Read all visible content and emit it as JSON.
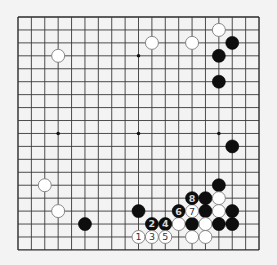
{
  "board": {
    "size": 19,
    "origin": {
      "x": 18,
      "y": 17
    },
    "spacing": {
      "x": 13.39,
      "y": 12.94
    },
    "stone_radius": 6.5,
    "colors": {
      "background": "#f3f3f3",
      "grid": "#3a3a3a",
      "black_stone": "#0e0e0e",
      "white_stone": "#ffffff",
      "white_stone_border": "#7a7a7a"
    },
    "hoshi": [
      [
        3,
        3
      ],
      [
        9,
        3
      ],
      [
        15,
        3
      ],
      [
        3,
        9
      ],
      [
        9,
        9
      ],
      [
        15,
        9
      ],
      [
        3,
        15
      ],
      [
        9,
        15
      ],
      [
        15,
        15
      ]
    ]
  },
  "stones": [
    {
      "color": "white",
      "col": 3,
      "row": 3,
      "label": ""
    },
    {
      "color": "white",
      "col": 10,
      "row": 2,
      "label": ""
    },
    {
      "color": "white",
      "col": 13,
      "row": 2,
      "label": ""
    },
    {
      "color": "white",
      "col": 15,
      "row": 1,
      "label": ""
    },
    {
      "color": "black",
      "col": 16,
      "row": 2,
      "label": ""
    },
    {
      "color": "black",
      "col": 15,
      "row": 3,
      "label": ""
    },
    {
      "color": "black",
      "col": 15,
      "row": 5,
      "label": ""
    },
    {
      "color": "black",
      "col": 16,
      "row": 10,
      "label": ""
    },
    {
      "color": "white",
      "col": 2,
      "row": 13,
      "label": ""
    },
    {
      "color": "white",
      "col": 3,
      "row": 15,
      "label": ""
    },
    {
      "color": "black",
      "col": 5,
      "row": 16,
      "label": ""
    },
    {
      "color": "black",
      "col": 9,
      "row": 15,
      "label": ""
    },
    {
      "color": "black",
      "col": 15,
      "row": 13,
      "label": ""
    },
    {
      "color": "black",
      "col": 14,
      "row": 14,
      "label": ""
    },
    {
      "color": "white",
      "col": 15,
      "row": 14,
      "label": ""
    },
    {
      "color": "black",
      "col": 14,
      "row": 15,
      "label": ""
    },
    {
      "color": "white",
      "col": 15,
      "row": 15,
      "label": ""
    },
    {
      "color": "black",
      "col": 16,
      "row": 15,
      "label": ""
    },
    {
      "color": "white",
      "col": 12,
      "row": 16,
      "label": ""
    },
    {
      "color": "black",
      "col": 13,
      "row": 16,
      "label": ""
    },
    {
      "color": "white",
      "col": 14,
      "row": 16,
      "label": ""
    },
    {
      "color": "black",
      "col": 15,
      "row": 16,
      "label": ""
    },
    {
      "color": "black",
      "col": 16,
      "row": 16,
      "label": ""
    },
    {
      "color": "white",
      "col": 13,
      "row": 17,
      "label": ""
    },
    {
      "color": "white",
      "col": 14,
      "row": 17,
      "label": ""
    },
    {
      "color": "white",
      "col": 9,
      "row": 17,
      "label": "1"
    },
    {
      "color": "black",
      "col": 10,
      "row": 16,
      "label": "2"
    },
    {
      "color": "white",
      "col": 10,
      "row": 17,
      "label": "3"
    },
    {
      "color": "black",
      "col": 11,
      "row": 16,
      "label": "4"
    },
    {
      "color": "white",
      "col": 11,
      "row": 17,
      "label": "5"
    },
    {
      "color": "black",
      "col": 12,
      "row": 15,
      "label": "6"
    },
    {
      "color": "white",
      "col": 13,
      "row": 15,
      "label": "7"
    },
    {
      "color": "black",
      "col": 13,
      "row": 14,
      "label": "8"
    }
  ]
}
